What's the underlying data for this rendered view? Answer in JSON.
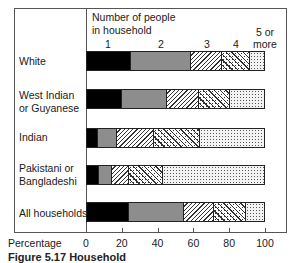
{
  "chart_data": {
    "type": "bar",
    "orientation": "horizontal-stacked",
    "title": "",
    "legend_title": "Number of people in household",
    "legend_title_lines": [
      "Number of people",
      "in household"
    ],
    "series_names": [
      "1",
      "2",
      "3",
      "4",
      "5 or more"
    ],
    "series_label_lines": [
      [
        "1"
      ],
      [
        "2"
      ],
      [
        "3"
      ],
      [
        "4"
      ],
      [
        "5 or",
        "more"
      ]
    ],
    "categories": [
      "White",
      "West Indian or Guyanese",
      "Indian",
      "Pakistani or Bangladeshi",
      "All households"
    ],
    "category_label_lines": [
      [
        "White"
      ],
      [
        "West Indian",
        "or Guyanese"
      ],
      [
        "Indian"
      ],
      [
        "Pakistani or",
        "Bangladeshi"
      ],
      [
        "All households"
      ]
    ],
    "series": [
      {
        "name": "1",
        "values": [
          25,
          20,
          6,
          7,
          24
        ]
      },
      {
        "name": "2",
        "values": [
          34,
          25,
          11,
          7,
          31
        ]
      },
      {
        "name": "3",
        "values": [
          17,
          18,
          21,
          10,
          17
        ]
      },
      {
        "name": "4",
        "values": [
          16,
          18,
          26,
          19,
          18
        ]
      },
      {
        "name": "5 or more",
        "values": [
          8,
          19,
          36,
          57,
          10
        ]
      }
    ],
    "xlabel": "Percentage",
    "ylabel": "",
    "xticks": [
      0,
      20,
      40,
      60,
      80,
      100
    ],
    "xlim": [
      0,
      100
    ],
    "grid": false,
    "legend_position": "top, labels above segments"
  },
  "caption_partial": "Figure 5.17 Household"
}
